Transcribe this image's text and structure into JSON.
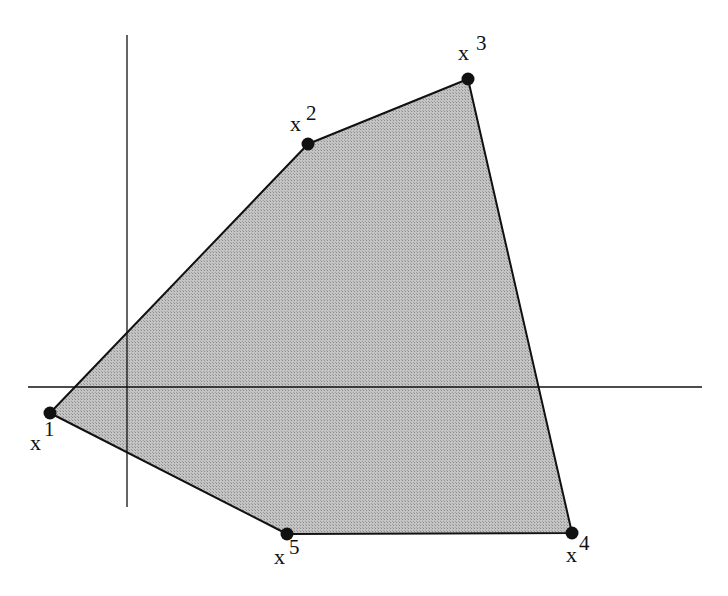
{
  "diagram": {
    "type": "convex polygon in 2D with coordinate axes",
    "fill_color": "#b8b8b8",
    "stroke_color": "#111111",
    "axes": {
      "horizontal": {
        "x1": 28,
        "y1": 387,
        "x2": 702,
        "y2": 387
      },
      "vertical": {
        "x1": 127,
        "y1": 35,
        "x2": 127,
        "y2": 507
      }
    },
    "vertices": [
      {
        "id": "x1",
        "base": "x",
        "sup": "1",
        "cx": 50,
        "cy": 413,
        "label_x": 30,
        "label_y": 450,
        "sup_x": 44,
        "sup_y": 436
      },
      {
        "id": "x2",
        "base": "x",
        "sup": "2",
        "cx": 308,
        "cy": 144,
        "label_x": 290,
        "label_y": 131,
        "sup_x": 306,
        "sup_y": 120
      },
      {
        "id": "x3",
        "base": "x",
        "sup": "3",
        "cx": 468,
        "cy": 79,
        "label_x": 458,
        "label_y": 60,
        "sup_x": 476,
        "sup_y": 50
      },
      {
        "id": "x4",
        "base": "x",
        "sup": "4",
        "cx": 572,
        "cy": 533,
        "label_x": 566,
        "label_y": 562,
        "sup_x": 579,
        "sup_y": 550
      },
      {
        "id": "x5",
        "base": "x",
        "sup": "5",
        "cx": 287,
        "cy": 534,
        "label_x": 274,
        "label_y": 564,
        "sup_x": 289,
        "sup_y": 554
      }
    ]
  }
}
